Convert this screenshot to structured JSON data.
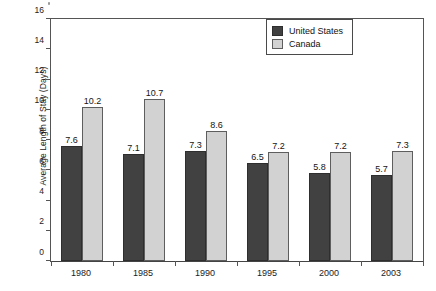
{
  "chart_data": {
    "type": "bar",
    "title": "",
    "subtitle": "",
    "xlabel": "",
    "ylabel": "Average Length of Stay (Days)",
    "categories": [
      "1980",
      "1985",
      "1990",
      "1995",
      "2000",
      "2003"
    ],
    "series": [
      {
        "name": "United States",
        "color": "#414141",
        "values": [
          7.6,
          7.1,
          7.3,
          6.5,
          5.8,
          5.7
        ]
      },
      {
        "name": "Canada",
        "color": "#d2d2d2",
        "values": [
          10.2,
          10.7,
          8.6,
          7.2,
          7.2,
          7.3
        ]
      }
    ],
    "ylim": [
      0,
      16
    ],
    "yticks": [
      0,
      2,
      4,
      6,
      8,
      10,
      12,
      14,
      16
    ],
    "ytick_labels": [
      "0",
      "2",
      "4",
      "6",
      "8",
      "10",
      "12",
      "14",
      "16"
    ],
    "grid": false,
    "data_labels": true,
    "legend_position": "top-right",
    "legend": [
      "United States",
      "Canada"
    ]
  },
  "legend": {
    "items": [
      {
        "label": "United States",
        "swatch": "us"
      },
      {
        "label": "Canada",
        "swatch": "ca"
      }
    ]
  },
  "axes": {
    "y_title": "Average Length of Stay (Days)"
  }
}
